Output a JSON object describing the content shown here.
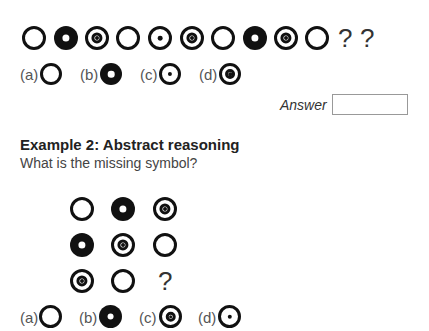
{
  "example1": {
    "sequence": [
      "ring",
      "donut",
      "target",
      "ring",
      "dot",
      "target",
      "ring",
      "donut",
      "target",
      "ring"
    ],
    "unknowns": [
      "?",
      "?"
    ],
    "options": [
      {
        "label": "(a)",
        "symbol": "ring"
      },
      {
        "label": "(b)",
        "symbol": "donut"
      },
      {
        "label": "(c)",
        "symbol": "dot"
      },
      {
        "label": "(d)",
        "symbol": "target"
      }
    ],
    "answer_label": "Answer",
    "answer_value": ""
  },
  "example2": {
    "heading": "Example 2: Abstract reasoning",
    "question": "What is the missing symbol?",
    "grid": [
      [
        "ring",
        "donut",
        "target"
      ],
      [
        "donut",
        "target",
        "ring"
      ],
      [
        "target",
        "ring",
        "?"
      ]
    ],
    "missing": "?",
    "options": [
      {
        "label": "(a)",
        "symbol": "ring"
      },
      {
        "label": "(b)",
        "symbol": "donut"
      },
      {
        "label": "(c)",
        "symbol": "target"
      },
      {
        "label": "(d)",
        "symbol": "dot"
      }
    ]
  }
}
